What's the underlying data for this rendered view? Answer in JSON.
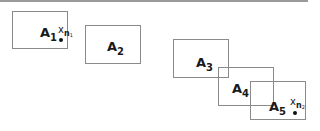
{
  "diagram": {
    "type": "overlapping-regions",
    "regions": [
      {
        "id": "A1",
        "base": "A",
        "sub": "1"
      },
      {
        "id": "A2",
        "base": "A",
        "sub": "2"
      },
      {
        "id": "A3",
        "base": "A",
        "sub": "3"
      },
      {
        "id": "A4",
        "base": "A",
        "sub": "4"
      },
      {
        "id": "A5",
        "base": "A",
        "sub": "5"
      }
    ],
    "points": [
      {
        "base": "x",
        "sub": "n",
        "subsub": "1",
        "region": "A1"
      },
      {
        "base": "x",
        "sub": "n",
        "subsub": "2",
        "region": "A5"
      }
    ],
    "colors": {
      "border": "#8a8a8a",
      "text": "#1a1a1a",
      "topline": "#9a9a9a"
    }
  }
}
